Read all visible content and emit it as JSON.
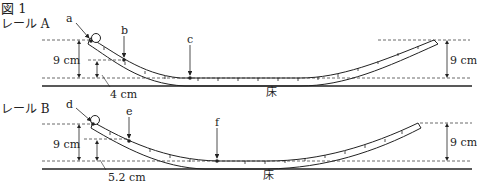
{
  "figure": {
    "title": "図 1",
    "floor_label": "床"
  },
  "rail_a": {
    "name": "レール A",
    "points": [
      "a",
      "b",
      "c"
    ],
    "start_height": "9 cm",
    "end_height": "9 cm",
    "b_height": "4 cm"
  },
  "rail_b": {
    "name": "レール B",
    "points": [
      "d",
      "e",
      "f"
    ],
    "start_height": "9 cm",
    "end_height": "9 cm",
    "e_height": "5.2 cm"
  }
}
